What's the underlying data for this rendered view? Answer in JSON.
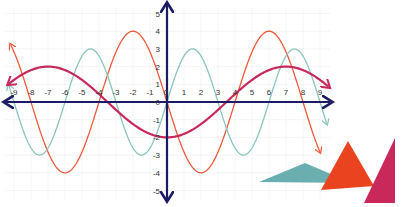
{
  "chart_data": {
    "type": "line",
    "title": "",
    "xlabel": "",
    "ylabel": "",
    "xlim": [
      -9,
      9
    ],
    "ylim": [
      -5,
      5
    ],
    "grid": true,
    "legend": null,
    "x_ticks": [
      -9,
      -8,
      -7,
      -6,
      -5,
      -4,
      -3,
      -2,
      -1,
      0,
      1,
      2,
      3,
      4,
      5,
      6,
      7,
      8,
      9
    ],
    "y_ticks": [
      -5,
      -4,
      -3,
      -2,
      -1,
      0,
      1,
      2,
      3,
      4,
      5
    ],
    "series": [
      {
        "name": "red sine curve",
        "color": "#ee5a3c",
        "function": "-4*sin(pi*x/4)",
        "amplitude": 4,
        "period": 8,
        "x_range": [
          -9.2,
          9.0
        ],
        "key_points": [
          [
            -8,
            0
          ],
          [
            -6,
            -4
          ],
          [
            -4,
            0
          ],
          [
            -2,
            4
          ],
          [
            0,
            0
          ],
          [
            2,
            -4
          ],
          [
            4,
            0
          ],
          [
            6,
            4
          ],
          [
            8,
            0
          ]
        ]
      },
      {
        "name": "teal sine curve",
        "color": "#8cc4be",
        "function": "3*sin(pi*x/3)",
        "amplitude": 3,
        "period": 6,
        "x_range": [
          -9.3,
          9.4
        ],
        "key_points": [
          [
            -9,
            0
          ],
          [
            -7.5,
            -3
          ],
          [
            -6,
            0
          ],
          [
            -4.5,
            3
          ],
          [
            -3,
            0
          ],
          [
            -1.5,
            -3
          ],
          [
            0,
            0
          ],
          [
            1.5,
            3
          ],
          [
            3,
            0
          ],
          [
            4.5,
            -3
          ],
          [
            6,
            0
          ],
          [
            7.5,
            3
          ],
          [
            9,
            0
          ]
        ]
      },
      {
        "name": "magenta cosine curve",
        "color": "#c8285a",
        "function": "-2*cos(pi*x/7)",
        "amplitude": 2,
        "period": 14,
        "x_range": [
          -9.3,
          9.5
        ],
        "key_points": [
          [
            -7,
            2
          ],
          [
            -3.5,
            0
          ],
          [
            0,
            -2
          ],
          [
            3.5,
            0
          ],
          [
            7,
            2
          ]
        ]
      }
    ],
    "axis_color": "#1c1c64"
  },
  "decorations": {
    "triangles": [
      {
        "name": "teal-triangle",
        "color": "#6aaeb0",
        "points": "259,182 305,163 352,183"
      },
      {
        "name": "orange-triangle",
        "color": "#ea4320",
        "points": "321,190 348,141 374,186"
      },
      {
        "name": "crimson-triangle",
        "color": "#c8285a",
        "points": "364,203 395,138 395,203"
      }
    ]
  },
  "layout": {
    "origin_px": [
      167,
      102
    ],
    "px_per_unit_x": 17,
    "px_per_unit_y": 17.7
  }
}
